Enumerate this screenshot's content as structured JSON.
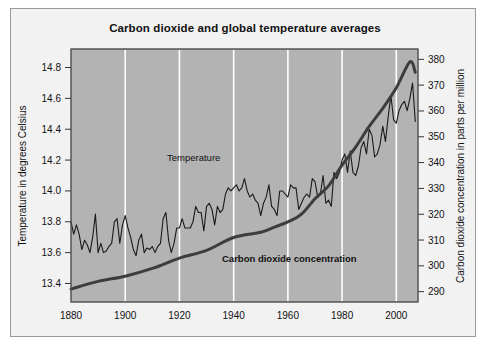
{
  "chart_data": {
    "type": "line",
    "title": "Carbon dioxide and global temperature averages",
    "xlabel": "",
    "grid": "vertical-white-gridlines",
    "legend_position": "inline-annotations",
    "xlim": [
      1880,
      2008
    ],
    "xticks": [
      "1880",
      "1900",
      "1920",
      "1940",
      "1960",
      "1980",
      "2000"
    ],
    "xtick_values": [
      1880,
      1900,
      1920,
      1940,
      1960,
      1980,
      2000
    ],
    "axes": [
      {
        "id": "left",
        "label": "Temperature  in degrees Celsius",
        "ticks": [
          "13.4",
          "13.6",
          "13.8",
          "14.0",
          "14.2",
          "14.4",
          "14.6",
          "14.8"
        ],
        "tick_values": [
          13.4,
          13.6,
          13.8,
          14.0,
          14.2,
          14.4,
          14.6,
          14.8
        ],
        "lim": [
          13.28,
          14.92
        ]
      },
      {
        "id": "right",
        "label": "Carbon dioxide concentration in parts per million",
        "ticks": [
          "290",
          "300",
          "310",
          "320",
          "330",
          "340",
          "350",
          "360",
          "370",
          "380"
        ],
        "tick_values": [
          290,
          300,
          310,
          320,
          330,
          340,
          350,
          360,
          370,
          380
        ],
        "lim": [
          286,
          384
        ]
      }
    ],
    "series": [
      {
        "name": "Temperature",
        "axis": "left",
        "unit": "degrees Celsius",
        "color": "#1a1a1a",
        "annotation_label": "Temperature",
        "x": [
          1880,
          1881,
          1882,
          1883,
          1884,
          1885,
          1886,
          1887,
          1888,
          1889,
          1890,
          1891,
          1892,
          1893,
          1894,
          1895,
          1896,
          1897,
          1898,
          1899,
          1900,
          1901,
          1902,
          1903,
          1904,
          1905,
          1906,
          1907,
          1908,
          1909,
          1910,
          1911,
          1912,
          1913,
          1914,
          1915,
          1916,
          1917,
          1918,
          1919,
          1920,
          1921,
          1922,
          1923,
          1924,
          1925,
          1926,
          1927,
          1928,
          1929,
          1930,
          1931,
          1932,
          1933,
          1934,
          1935,
          1936,
          1937,
          1938,
          1939,
          1940,
          1941,
          1942,
          1943,
          1944,
          1945,
          1946,
          1947,
          1948,
          1949,
          1950,
          1951,
          1952,
          1953,
          1954,
          1955,
          1956,
          1957,
          1958,
          1959,
          1960,
          1961,
          1962,
          1963,
          1964,
          1965,
          1966,
          1967,
          1968,
          1969,
          1970,
          1971,
          1972,
          1973,
          1974,
          1975,
          1976,
          1977,
          1978,
          1979,
          1980,
          1981,
          1982,
          1983,
          1984,
          1985,
          1986,
          1987,
          1988,
          1989,
          1990,
          1991,
          1992,
          1993,
          1994,
          1995,
          1996,
          1997,
          1998,
          1999,
          2000,
          2001,
          2002,
          2003,
          2004,
          2005,
          2006,
          2007
        ],
        "values": [
          13.8,
          13.72,
          13.78,
          13.72,
          13.62,
          13.68,
          13.65,
          13.6,
          13.7,
          13.85,
          13.6,
          13.66,
          13.6,
          13.61,
          13.64,
          13.66,
          13.8,
          13.82,
          13.66,
          13.78,
          13.84,
          13.76,
          13.7,
          13.62,
          13.58,
          13.68,
          13.72,
          13.6,
          13.63,
          13.62,
          13.64,
          13.6,
          13.64,
          13.66,
          13.82,
          13.86,
          13.68,
          13.6,
          13.66,
          13.76,
          13.76,
          13.82,
          13.76,
          13.76,
          13.76,
          13.8,
          13.9,
          13.86,
          13.86,
          13.74,
          13.9,
          13.92,
          13.88,
          13.78,
          13.9,
          13.86,
          13.88,
          13.98,
          14.02,
          14.0,
          14.02,
          14.04,
          14.0,
          14.02,
          14.08,
          14.0,
          13.96,
          13.98,
          13.94,
          13.92,
          13.84,
          13.92,
          13.96,
          14.04,
          13.9,
          13.88,
          13.84,
          14.0,
          14.0,
          13.98,
          13.96,
          14.04,
          14.02,
          14.02,
          13.88,
          13.92,
          13.96,
          13.98,
          13.96,
          14.08,
          14.06,
          13.96,
          13.98,
          14.1,
          13.92,
          13.94,
          13.9,
          14.12,
          14.08,
          14.12,
          14.2,
          14.24,
          14.12,
          14.26,
          14.12,
          14.1,
          14.16,
          14.28,
          14.32,
          14.24,
          14.4,
          14.36,
          14.22,
          14.24,
          14.3,
          14.42,
          14.32,
          14.48,
          14.62,
          14.46,
          14.44,
          14.52,
          14.56,
          14.58,
          14.52,
          14.6,
          14.7,
          14.45
        ]
      },
      {
        "name": "Carbon dioxide concentration",
        "axis": "right",
        "unit": "parts per million",
        "color": "#3d3d3d",
        "annotation_label": "Carbon dioxide concentration",
        "x": [
          1880,
          1890,
          1900,
          1910,
          1920,
          1930,
          1940,
          1950,
          1955,
          1960,
          1965,
          1970,
          1975,
          1980,
          1985,
          1990,
          1995,
          2000,
          2005,
          2007
        ],
        "values": [
          291,
          294,
          296,
          299,
          303,
          306,
          311,
          313,
          315,
          317,
          320,
          326,
          331,
          339,
          346,
          354,
          361,
          369,
          379,
          375
        ]
      }
    ],
    "annotations": [
      {
        "text": "Temperature",
        "x": 1913,
        "y_axis": "left",
        "y": 14.12,
        "bold": false
      },
      {
        "text": "Carbon dioxide concentration",
        "x": 1943,
        "y_axis": "right",
        "y": 298,
        "bold": true
      }
    ],
    "plot_background": "#b3b3b3",
    "gridline_color": "#ffffff",
    "figure_background": "#f2f2f2"
  }
}
